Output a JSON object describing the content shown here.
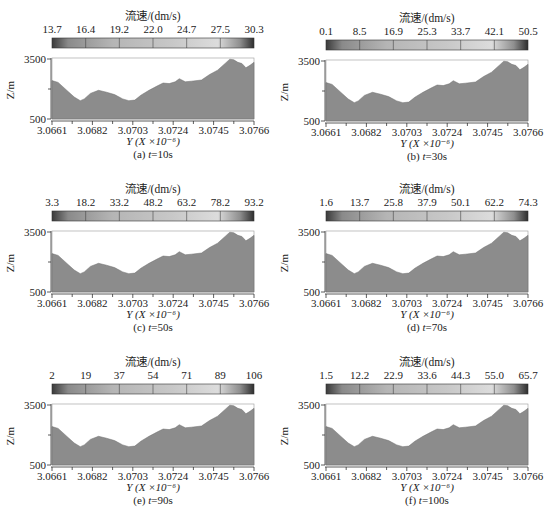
{
  "figure": {
    "colorbar_title": "流速/(dm/s)",
    "ylabel": "Z/m",
    "xlabel": "Y (X ×10⁻⁶)",
    "y_ticks": [
      "3500",
      "500"
    ],
    "x_ticks": [
      "3.0661",
      "3.0682",
      "3.0703",
      "3.0724",
      "3.0745",
      "3.0766"
    ],
    "terrain_color": "#8c8c8c",
    "panels": [
      {
        "id": "a",
        "caption": "(a) t=10s",
        "caption_prefix": "(a) ",
        "caption_t": "t",
        "caption_suffix": "=10s",
        "colorbar_ticks": [
          "13.7",
          "16.4",
          "19.2",
          "22.0",
          "24.7",
          "27.5",
          "30.3"
        ]
      },
      {
        "id": "b",
        "caption": "(b) t=30s",
        "caption_prefix": "(b) ",
        "caption_t": "t",
        "caption_suffix": "=30s",
        "colorbar_ticks": [
          "0.1",
          "8.5",
          "16.9",
          "25.3",
          "33.7",
          "42.1",
          "50.5"
        ]
      },
      {
        "id": "c",
        "caption": "(c) t=50s",
        "caption_prefix": "(c) ",
        "caption_t": "t",
        "caption_suffix": "=50s",
        "colorbar_ticks": [
          "3.3",
          "18.2",
          "33.2",
          "48.2",
          "63.2",
          "78.2",
          "93.2"
        ]
      },
      {
        "id": "d",
        "caption": "(d) t=70s",
        "caption_prefix": "(d) ",
        "caption_t": "t",
        "caption_suffix": "=70s",
        "colorbar_ticks": [
          "1.6",
          "13.7",
          "25.8",
          "37.9",
          "50.1",
          "62.2",
          "74.3"
        ]
      },
      {
        "id": "e",
        "caption": "(e) t=90s",
        "caption_prefix": "(e) ",
        "caption_t": "t",
        "caption_suffix": "=90s",
        "colorbar_ticks": [
          "2",
          "19",
          "37",
          "54",
          "71",
          "89",
          "106"
        ]
      },
      {
        "id": "f",
        "caption": "(f) t=100s",
        "caption_prefix": "(f) ",
        "caption_t": "t",
        "caption_suffix": "=100s",
        "colorbar_ticks": [
          "1.5",
          "12.2",
          "22.9",
          "33.6",
          "44.3",
          "55.0",
          "65.7"
        ]
      }
    ]
  },
  "chart_data": [
    {
      "type": "area",
      "title": "(a) t=10s",
      "colorbar_label": "流速/(dm/s)",
      "colorbar_ticks": [
        13.7,
        16.4,
        19.2,
        22.0,
        24.7,
        27.5,
        30.3
      ],
      "xlabel": "Y (X ×10⁻⁶)",
      "ylabel": "Z/m",
      "ylim": [
        500,
        3500
      ],
      "xlim": [
        3.0661,
        3.0766
      ],
      "x_ticks": [
        3.0661,
        3.0682,
        3.0703,
        3.0724,
        3.0745,
        3.0766
      ],
      "y_ticks": [
        500,
        3500
      ]
    },
    {
      "type": "area",
      "title": "(b) t=30s",
      "colorbar_label": "流速/(dm/s)",
      "colorbar_ticks": [
        0.1,
        8.5,
        16.9,
        25.3,
        33.7,
        42.1,
        50.5
      ],
      "xlabel": "Y (X ×10⁻⁶)",
      "ylabel": "Z/m",
      "ylim": [
        500,
        3500
      ],
      "xlim": [
        3.0661,
        3.0766
      ],
      "x_ticks": [
        3.0661,
        3.0682,
        3.0703,
        3.0724,
        3.0745,
        3.0766
      ],
      "y_ticks": [
        500,
        3500
      ]
    },
    {
      "type": "area",
      "title": "(c) t=50s",
      "colorbar_label": "流速/(dm/s)",
      "colorbar_ticks": [
        3.3,
        18.2,
        33.2,
        48.2,
        63.2,
        78.2,
        93.2
      ],
      "xlabel": "Y (X ×10⁻⁶)",
      "ylabel": "Z/m",
      "ylim": [
        500,
        3500
      ],
      "xlim": [
        3.0661,
        3.0766
      ],
      "x_ticks": [
        3.0661,
        3.0682,
        3.0703,
        3.0724,
        3.0745,
        3.0766
      ],
      "y_ticks": [
        500,
        3500
      ]
    },
    {
      "type": "area",
      "title": "(d) t=70s",
      "colorbar_label": "流速/(dm/s)",
      "colorbar_ticks": [
        1.6,
        13.7,
        25.8,
        37.9,
        50.1,
        62.2,
        74.3
      ],
      "xlabel": "Y (X ×10⁻⁶)",
      "ylabel": "Z/m",
      "ylim": [
        500,
        3500
      ],
      "xlim": [
        3.0661,
        3.0766
      ],
      "x_ticks": [
        3.0661,
        3.0682,
        3.0703,
        3.0724,
        3.0745,
        3.0766
      ],
      "y_ticks": [
        500,
        3500
      ]
    },
    {
      "type": "area",
      "title": "(e) t=90s",
      "colorbar_label": "流速/(dm/s)",
      "colorbar_ticks": [
        2,
        19,
        37,
        54,
        71,
        89,
        106
      ],
      "xlabel": "Y (X ×10⁻⁶)",
      "ylabel": "Z/m",
      "ylim": [
        500,
        3500
      ],
      "xlim": [
        3.0661,
        3.0766
      ],
      "x_ticks": [
        3.0661,
        3.0682,
        3.0703,
        3.0724,
        3.0745,
        3.0766
      ],
      "y_ticks": [
        500,
        3500
      ]
    },
    {
      "type": "area",
      "title": "(f) t=100s",
      "colorbar_label": "流速/(dm/s)",
      "colorbar_ticks": [
        1.5,
        12.2,
        22.9,
        33.6,
        44.3,
        55.0,
        65.7
      ],
      "xlabel": "Y (X ×10⁻⁶)",
      "ylabel": "Z/m",
      "ylim": [
        500,
        3500
      ],
      "xlim": [
        3.0661,
        3.0766
      ],
      "x_ticks": [
        3.0661,
        3.0682,
        3.0703,
        3.0724,
        3.0745,
        3.0766
      ],
      "y_ticks": [
        500,
        3500
      ]
    }
  ]
}
